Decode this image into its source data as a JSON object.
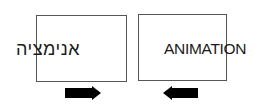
{
  "diagram": {
    "left_panel": {
      "text": "אנימציה",
      "arrow_direction": "right"
    },
    "right_panel": {
      "text": "ANIMATION",
      "arrow_direction": "left"
    },
    "colors": {
      "frame": "#555555",
      "text": "#1a1a1a",
      "arrow": "#000000"
    }
  }
}
